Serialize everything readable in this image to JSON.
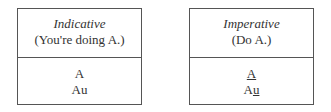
{
  "boxes": [
    {
      "title": "Indicative",
      "subtitle": "(You're doing A.)",
      "lines": [
        {
          "parts": [
            {
              "text": "A",
              "underline": false
            }
          ]
        },
        {
          "parts": [
            {
              "text": "Au",
              "underline": false
            }
          ]
        }
      ]
    },
    {
      "title": "Imperative",
      "subtitle": "(Do A.)",
      "lines": [
        {
          "parts": [
            {
              "text": "A",
              "underline": true
            }
          ]
        },
        {
          "parts": [
            {
              "text": "A",
              "underline": false
            },
            {
              "text": "u",
              "underline": true
            }
          ]
        }
      ]
    }
  ]
}
